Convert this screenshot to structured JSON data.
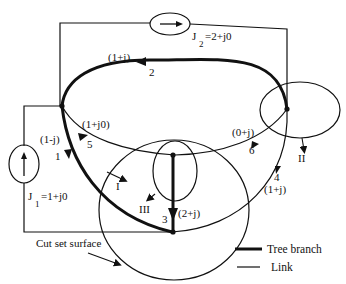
{
  "diagram": {
    "sources": {
      "J1": {
        "label_main": "J",
        "label_sub": "1",
        "label_value": "=1+j0",
        "arrow": "up"
      },
      "J2": {
        "label_main": "J",
        "label_sub": "2",
        "label_value": "=2+j0",
        "arrow": "right"
      }
    },
    "branches": [
      {
        "id": "1",
        "number": "1",
        "impedance": "(1-j)",
        "type": "tree"
      },
      {
        "id": "2",
        "number": "2",
        "impedance": "(1+j)",
        "type": "tree"
      },
      {
        "id": "3",
        "number": "3",
        "impedance": "(2+j)",
        "type": "tree"
      },
      {
        "id": "4",
        "number": "4",
        "impedance": "(1+j)",
        "type": "link"
      },
      {
        "id": "5",
        "number": "5",
        "impedance": "(1+j0)",
        "type": "link"
      },
      {
        "id": "6",
        "number": "6",
        "impedance": "(0+j)",
        "type": "link"
      }
    ],
    "cutsets": [
      {
        "id": "I",
        "label": "I"
      },
      {
        "id": "II",
        "label": "II"
      },
      {
        "id": "III",
        "label": "III"
      }
    ],
    "annotation": "Cut set surface",
    "legend": {
      "tree_branch": "Tree branch",
      "link": "Link"
    },
    "colors": {
      "line": "#111111",
      "background": "#ffffff"
    }
  }
}
